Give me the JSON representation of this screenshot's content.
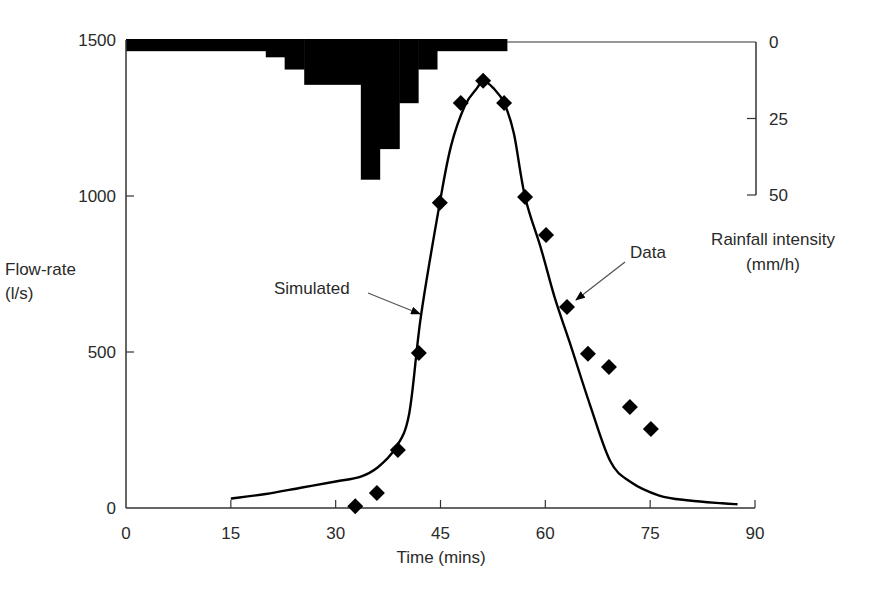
{
  "chart_data": {
    "type": "line",
    "title": "",
    "xlabel": "Time (mins)",
    "ylabel": "Flow-rate (l/s)",
    "ylabel_lines": [
      "Flow-rate",
      "(l/s)"
    ],
    "y2label": "Rainfall intensity (mm/h)",
    "y2label_lines": [
      "Rainfall intensity",
      "(mm/h)"
    ],
    "xlim": [
      0,
      90
    ],
    "ylim": [
      0,
      1500
    ],
    "y2lim": [
      0,
      50
    ],
    "y2_inverted": true,
    "grid": false,
    "legend": "none (inline annotations)",
    "x_ticks": [
      0,
      15,
      30,
      45,
      60,
      75,
      90
    ],
    "y_ticks": [
      0,
      500,
      1000,
      1500
    ],
    "y2_ticks": [
      0,
      25,
      50
    ],
    "series": [
      {
        "name": "Simulated",
        "kind": "line",
        "x": [
          15,
          20,
          25,
          30,
          33.5,
          36,
          38.5,
          40.5,
          42.2,
          44.9,
          46.5,
          48.5,
          50.2,
          51.1,
          52.6,
          54.1,
          55.5,
          57.1,
          59.4,
          61.4,
          63.5,
          66.4,
          69.3,
          72.1,
          76.3,
          80.6,
          85.3,
          87.5
        ],
        "values": [
          30,
          45,
          65,
          85,
          100,
          130,
          190,
          300,
          615,
          978,
          1160,
          1290,
          1345,
          1369,
          1345,
          1298,
          1200,
          997,
          830,
          670,
          530,
          330,
          150,
          85,
          40,
          24,
          15,
          12
        ]
      },
      {
        "name": "Data",
        "kind": "scatter",
        "marker": "diamond",
        "x": [
          32.8,
          35.9,
          38.9,
          41.9,
          44.9,
          47.9,
          51.1,
          54.1,
          57.1,
          60.1,
          63.1,
          66.1,
          69.1,
          72.1,
          75.1
        ],
        "values": [
          6,
          48,
          186,
          497,
          978,
          1298,
          1369,
          1298,
          997,
          875,
          644,
          494,
          452,
          324,
          253
        ]
      },
      {
        "name": "Rainfall intensity",
        "kind": "bar",
        "axis": "y2",
        "x_start": [
          0,
          20,
          22.7,
          25.5,
          33.6,
          36.3,
          39.1,
          41.8,
          44.5
        ],
        "x_end": [
          20,
          22.7,
          25.5,
          33.6,
          36.3,
          39.1,
          41.8,
          44.5,
          54.5
        ],
        "values": [
          3,
          5,
          9,
          14,
          45,
          35,
          20,
          9,
          3
        ]
      }
    ],
    "annotations": [
      {
        "text": "Simulated",
        "target_series": "Simulated",
        "arrow": true
      },
      {
        "text": "Data",
        "target_series": "Data",
        "arrow": true
      }
    ],
    "colors": {
      "line": "#000000",
      "marker": "#000000",
      "bars": "#000000",
      "axis": "#333333",
      "text": "#2a2a2a",
      "arrow": "#555555"
    }
  }
}
